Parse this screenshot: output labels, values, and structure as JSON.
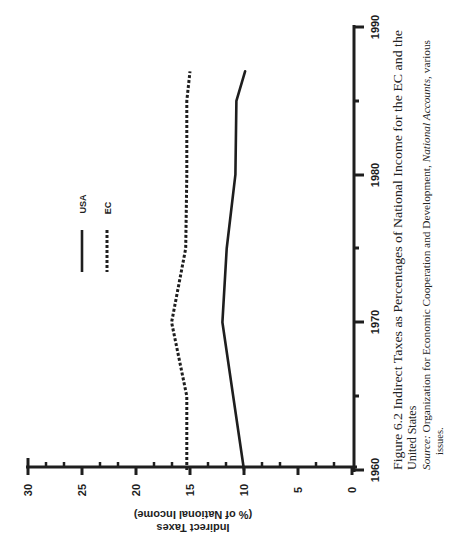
{
  "figure": {
    "caption_line1": "Figure 6.2 Indirect Taxes as Percentages of National Income for the EC and the",
    "caption_line2": "United States",
    "source_label": "Source:",
    "source_text_1": "Organization for Economic Cooperation and Development,",
    "source_italic": "National Accounts,",
    "source_text_2": "various",
    "source_line2": "issues."
  },
  "axes": {
    "y_label_line1": "Indirect Taxes",
    "y_label_line2": "(% of National Income)",
    "y_ticks": [
      "0",
      "5",
      "10",
      "15",
      "20",
      "25",
      "30"
    ],
    "x_ticks": [
      "1960",
      "1970",
      "1980",
      "1990"
    ]
  },
  "legend": {
    "usa": "USA",
    "ec": "EC"
  },
  "colors": {
    "ink": "#1e1e1e",
    "background": "#ffffff"
  },
  "chart_data": {
    "type": "line",
    "title": "Figure 6.2 Indirect Taxes as Percentages of National Income for the EC and the United States",
    "xlabel": "",
    "ylabel": "Indirect Taxes (% of National Income)",
    "xlim": [
      1960,
      1990
    ],
    "ylim": [
      0,
      30
    ],
    "x_ticks": [
      1960,
      1970,
      1980,
      1990
    ],
    "y_ticks": [
      0,
      5,
      10,
      15,
      20,
      25,
      30
    ],
    "grid": false,
    "legend_position": "upper-left (rotated figure)",
    "orientation_note": "Figure rendered rotated 90 degrees counterclockwise on the page",
    "x": [
      1960,
      1965,
      1970,
      1975,
      1980,
      1985,
      1987
    ],
    "series": [
      {
        "name": "USA",
        "style": "solid",
        "values": [
          10.0,
          11.0,
          12.0,
          11.6,
          10.8,
          10.7,
          9.9
        ]
      },
      {
        "name": "EC",
        "style": "dotted",
        "values": [
          15.3,
          15.3,
          16.7,
          15.4,
          15.3,
          15.3,
          15.0
        ]
      }
    ],
    "source": "Organization for Economic Cooperation and Development, National Accounts, various issues."
  }
}
